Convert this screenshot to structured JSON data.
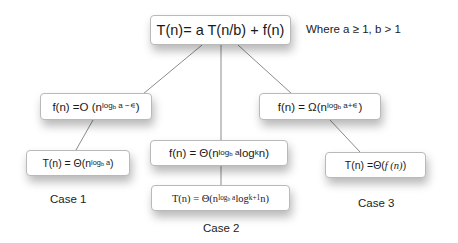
{
  "root": {
    "formula": "T(n)= a T(n/b) + f(n)",
    "condition": "Where a ≥ 1, b > 1"
  },
  "branches": [
    {
      "case_label": "Case 1",
      "condition": {
        "prefix": "f(n) =O (n",
        "exponent_log": "log",
        "exponent_base": "b",
        "exponent_rest": " a −∊",
        "suffix": " )"
      },
      "result": {
        "prefix": "T(n) = Θ(n",
        "exponent_log": "log",
        "exponent_base": "b",
        "exponent_rest": " a",
        "suffix": " )"
      }
    },
    {
      "case_label": "Case 2",
      "condition": {
        "prefix": "f(n) = Θ(n",
        "exponent_log": "log",
        "exponent_base": "b",
        "exponent_rest": " a",
        "middle": " log",
        "middle_sup": "k",
        "suffix": " n)"
      },
      "result": {
        "prefix": "T(n) = Θ(n",
        "exponent_log": "log",
        "exponent_base": "b",
        "exponent_rest": " a",
        "middle": " log",
        "middle_sup": "k+1",
        "suffix": " n)"
      }
    },
    {
      "case_label": "Case 3",
      "condition": {
        "prefix": "f(n) = Ω(n",
        "exponent_log": "log",
        "exponent_base": "b",
        "exponent_rest": " a+∊",
        "suffix": " )"
      },
      "result": {
        "prefix": "T(n) =Θ(",
        "func": "f (n)",
        "suffix": ")"
      }
    }
  ],
  "colors": {
    "line": "#8c8c8c",
    "box_border": "#b9b9b9",
    "text": "#1a1a1a"
  }
}
